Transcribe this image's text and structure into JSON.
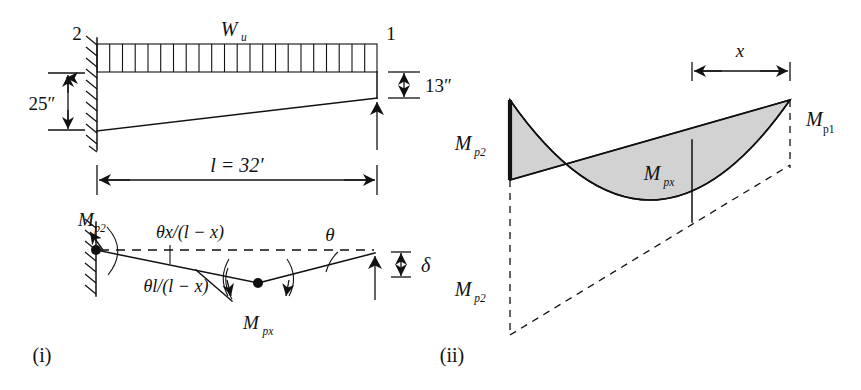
{
  "figure": {
    "panels": [
      {
        "id": "i",
        "caption": "(i)",
        "x": 42,
        "y": 362
      },
      {
        "id": "ii",
        "caption": "(ii)",
        "x": 452,
        "y": 362
      }
    ]
  },
  "beam_diagram": {
    "node_left_label": "2",
    "node_right_label": "1",
    "load_label_main": "W",
    "load_label_sub": "u",
    "depth_left": "25″",
    "depth_right": "13″",
    "span_label": "l = 32′",
    "load_divisions": 22
  },
  "mechanism_diagram": {
    "moment_left_main": "M",
    "moment_left_sub": "p2",
    "moment_hinge_main": "M",
    "moment_hinge_sub": "px",
    "rotation_top": "θx/(l − x)",
    "rotation_bottom": "θl/(l − x)",
    "rotation_right": "θ",
    "deflection": "δ"
  },
  "moment_diagram": {
    "label_mp2_upper_main": "M",
    "label_mp2_upper_sub": "p2",
    "label_mp2_lower_main": "M",
    "label_mp2_lower_sub": "p2",
    "label_mp1_main": "M",
    "label_mp1_sub": "p1",
    "label_mpx_main": "M",
    "label_mpx_sub": "px",
    "dimension_x": "x"
  },
  "colors": {
    "ink": "#111111",
    "shade": "#d2d2d2",
    "background": "#ffffff"
  }
}
